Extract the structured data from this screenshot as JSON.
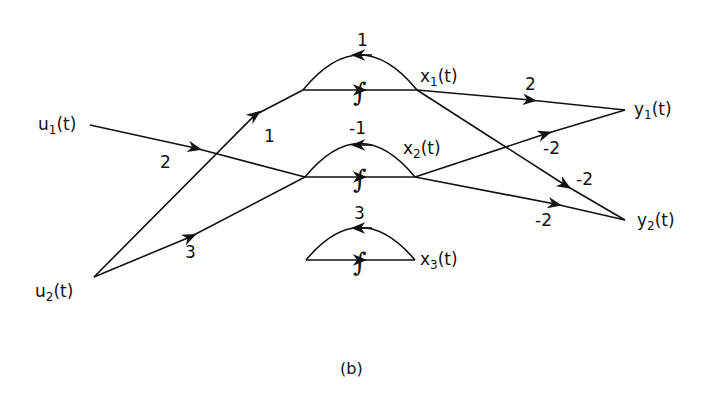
{
  "nodes": {
    "u1": {
      "name": "u",
      "sub": "1",
      "arg": "(t)"
    },
    "u2": {
      "name": "u",
      "sub": "2",
      "arg": "(t)"
    },
    "x1": {
      "name": "x",
      "sub": "1",
      "arg": "(t)"
    },
    "x2": {
      "name": "x",
      "sub": "2",
      "arg": "(t)"
    },
    "x3": {
      "name": "x",
      "sub": "3",
      "arg": "(t)"
    },
    "y1": {
      "name": "y",
      "sub": "1",
      "arg": "(t)"
    },
    "y2": {
      "name": "y",
      "sub": "2",
      "arg": "(t)"
    }
  },
  "gains": {
    "u1_to_x2": "2",
    "u2_to_x1": "1",
    "u2_to_x2": "3",
    "loop_x1": "1",
    "loop_x2": "-1",
    "loop_x3": "3",
    "x1_to_y1": "2",
    "x1_to_y2": "-2",
    "x2_to_y1": "-2",
    "x2_to_y2": "-2"
  },
  "integrator_symbol": "∫",
  "caption": "(b)"
}
